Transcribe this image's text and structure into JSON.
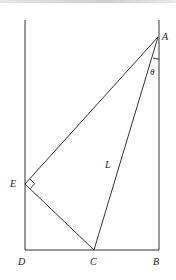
{
  "diagram": {
    "type": "geometry",
    "points": {
      "A": {
        "label": "A",
        "x": 158,
        "y": 37
      },
      "B": {
        "label": "B",
        "x": 159,
        "y": 250
      },
      "C": {
        "label": "C",
        "x": 94,
        "y": 250
      },
      "D": {
        "label": "D",
        "x": 25,
        "y": 250
      },
      "E": {
        "label": "E",
        "x": 25,
        "y": 184
      }
    },
    "segments": [
      {
        "from": "A",
        "to": "E"
      },
      {
        "from": "A",
        "to": "C",
        "label": "L"
      },
      {
        "from": "E",
        "to": "C"
      },
      {
        "from": "D",
        "to": "B"
      }
    ],
    "walls": [
      {
        "name": "left-wall",
        "x": 25,
        "y_top": 20,
        "y_bottom": 250
      },
      {
        "name": "right-wall",
        "x": 159,
        "y_top": 20,
        "y_bottom": 250
      }
    ],
    "angles": [
      {
        "label": "θ",
        "vertex": "A",
        "between": [
          "B",
          "C"
        ]
      }
    ],
    "right_angles": [
      {
        "vertex": "E"
      }
    ],
    "labels": {
      "A": "A",
      "B": "B",
      "C": "C",
      "D": "D",
      "E": "E",
      "L": "L",
      "theta": "θ"
    },
    "stroke_color": "#333333"
  }
}
